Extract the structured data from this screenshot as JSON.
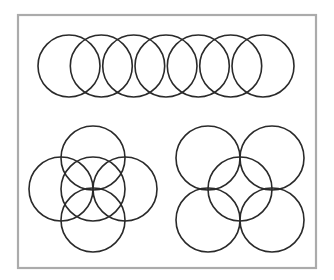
{
  "figure": {
    "frame": {
      "x": 18,
      "y": 15,
      "width": 298,
      "height": 253,
      "stroke": "#ababab",
      "stroke_width": 2.2
    },
    "circle_stroke": "#2a2a2a",
    "circle_stroke_width": 1.6,
    "groups": [
      {
        "name": "row-of-seven",
        "radius": 31,
        "circles": [
          {
            "cx": 69,
            "cy": 66
          },
          {
            "cx": 101.3,
            "cy": 66
          },
          {
            "cx": 133.7,
            "cy": 66
          },
          {
            "cx": 166,
            "cy": 66
          },
          {
            "cx": 198.3,
            "cy": 66
          },
          {
            "cx": 230.7,
            "cy": 66
          },
          {
            "cx": 263,
            "cy": 66
          }
        ]
      },
      {
        "name": "plus-cluster",
        "radius": 32,
        "circles": [
          {
            "cx": 93,
            "cy": 158
          },
          {
            "cx": 61,
            "cy": 189
          },
          {
            "cx": 93,
            "cy": 189
          },
          {
            "cx": 125,
            "cy": 189
          },
          {
            "cx": 93,
            "cy": 220
          }
        ]
      },
      {
        "name": "x-cluster",
        "radius": 32,
        "circles": [
          {
            "cx": 208,
            "cy": 158
          },
          {
            "cx": 272,
            "cy": 158
          },
          {
            "cx": 240,
            "cy": 189
          },
          {
            "cx": 208,
            "cy": 220
          },
          {
            "cx": 272,
            "cy": 220
          }
        ]
      }
    ]
  }
}
